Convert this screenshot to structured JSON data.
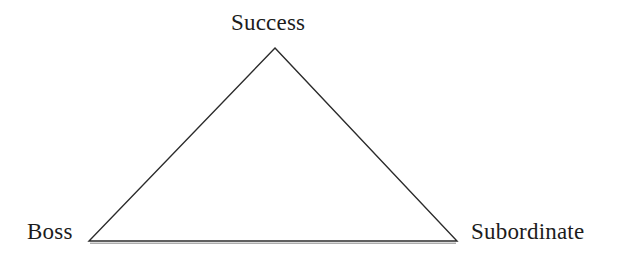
{
  "diagram": {
    "type": "triangle-relationship-diagram",
    "shape_name": "triangle",
    "background_color": "#ffffff",
    "stroke_color": "#2b2b2b",
    "stroke_width": 1.4,
    "text_color": "#1c1c1c",
    "vertices": [
      {
        "id": "apex",
        "label": "Success",
        "position": "top",
        "x": 275,
        "y": 48
      },
      {
        "id": "bottom-left",
        "label": "Boss",
        "position": "bottom-left",
        "x": 89,
        "y": 241
      },
      {
        "id": "bottom-right",
        "label": "Subordinate",
        "position": "bottom-right",
        "x": 457,
        "y": 241
      }
    ],
    "labels": {
      "apex": "Success",
      "bottom_left": "Boss",
      "bottom_right": "Subordinate"
    }
  }
}
